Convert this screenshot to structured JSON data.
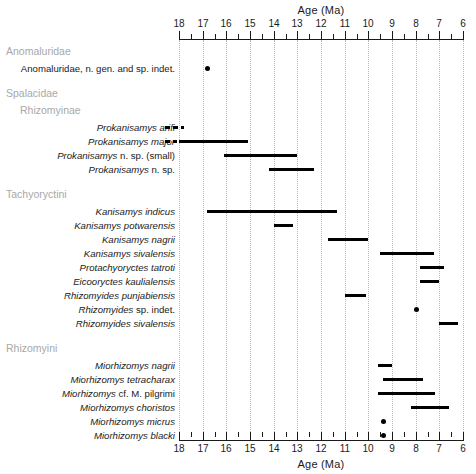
{
  "chart_data": {
    "type": "range_bar",
    "title": "",
    "xlabel": "Age (Ma)",
    "ylabel": "",
    "xlim": [
      18,
      6
    ],
    "x_reversed": true,
    "x_ticks": [
      18,
      17,
      16,
      15,
      14,
      13,
      12,
      11,
      10,
      9,
      8,
      7,
      6
    ],
    "x_minor_ticks": [
      17.5,
      16.5,
      15.5,
      14.5,
      13.5,
      12.5,
      11.5,
      10.5,
      9.5,
      8.5,
      7.5,
      6.5
    ],
    "grid": true,
    "grid_axis": "x",
    "grid_style": "dotted",
    "legend": "none",
    "axis_top": true,
    "axis_bottom": true,
    "bar_color": "#000000",
    "grid_color": "#b9b9b9",
    "heading_color": "#a8a8a8",
    "groups": [
      {
        "name": "Anomaluridae",
        "level": 0,
        "taxa": [
          {
            "label": "Anomaluridae, n. gen. and sp. indet.",
            "italic": false,
            "mark": "point",
            "start": 16.8,
            "end": 16.8
          }
        ]
      },
      {
        "name": "Spalacidae",
        "level": 0,
        "taxa": []
      },
      {
        "name": "Rhizomyinae",
        "level": 1,
        "taxa": [
          {
            "label": "Prokanisamys arifi",
            "italic": true,
            "mark": "dashed",
            "start": 18.6,
            "end": 17.8
          },
          {
            "label": "Prokanisamys major",
            "italic": true,
            "mark": "dashed-then-bar",
            "dash_start": 18.6,
            "dash_end": 18.1,
            "start": 18.0,
            "end": 15.1
          },
          {
            "label": "Prokanisamys n. sp. (small)",
            "italic_prefix": "Prokanisamys",
            "italic": false,
            "mark": "bar",
            "start": 16.1,
            "end": 13.0
          },
          {
            "label": "Prokanisamys n. sp.",
            "italic_prefix": "Prokanisamys",
            "italic": false,
            "mark": "bar",
            "start": 14.2,
            "end": 12.3
          }
        ]
      },
      {
        "name": "Tachyoryctini",
        "level": 0,
        "taxa": [
          {
            "label": "Kanisamys indicus",
            "italic": true,
            "mark": "bar",
            "start": 16.8,
            "end": 11.3
          },
          {
            "label": "Kanisamys potwarensis",
            "italic": true,
            "mark": "bar",
            "start": 14.0,
            "end": 13.2
          },
          {
            "label": "Kanisamys nagrii",
            "italic": true,
            "mark": "bar",
            "start": 11.7,
            "end": 10.0
          },
          {
            "label": "Kanisamys sivalensis",
            "italic": true,
            "mark": "bar",
            "start": 9.5,
            "end": 7.2
          },
          {
            "label": "Protachyoryctes tatroti",
            "italic": true,
            "mark": "bar",
            "start": 7.8,
            "end": 6.8
          },
          {
            "label": "Eicooryctes kaulialensis",
            "italic": true,
            "mark": "bar",
            "start": 7.8,
            "end": 7.0
          },
          {
            "label": "Rhizomyides punjabiensis",
            "italic": true,
            "mark": "bar",
            "start": 11.0,
            "end": 10.1
          },
          {
            "label": "Rhizomyides sp. indet.",
            "italic_prefix": "Rhizomyides",
            "italic": false,
            "mark": "point",
            "start": 8.0,
            "end": 8.0
          },
          {
            "label": "Rhizomyides sivalensis",
            "italic": true,
            "mark": "bar",
            "start": 7.0,
            "end": 6.2
          }
        ]
      },
      {
        "name": "Rhizomyini",
        "level": 0,
        "taxa": [
          {
            "label": "Miorhizomys nagrii",
            "italic": true,
            "mark": "bar",
            "start": 9.6,
            "end": 9.0
          },
          {
            "label": "Miorhizomys tetracharax",
            "italic": true,
            "mark": "bar",
            "start": 9.4,
            "end": 7.7
          },
          {
            "label": "Miorhizomys cf. M. pilgrimi",
            "italic_prefix": "Miorhizomys",
            "italic": false,
            "mark": "bar",
            "start": 9.6,
            "end": 7.2
          },
          {
            "label": "Miorhizomys choristos",
            "italic": true,
            "mark": "bar",
            "start": 8.2,
            "end": 6.6
          },
          {
            "label": "Miorhizomys micrus",
            "italic": true,
            "mark": "point",
            "start": 9.4,
            "end": 9.4
          },
          {
            "label": "Miorhizomys blacki",
            "italic": true,
            "mark": "point",
            "start": 9.4,
            "end": 9.4
          }
        ]
      }
    ]
  }
}
